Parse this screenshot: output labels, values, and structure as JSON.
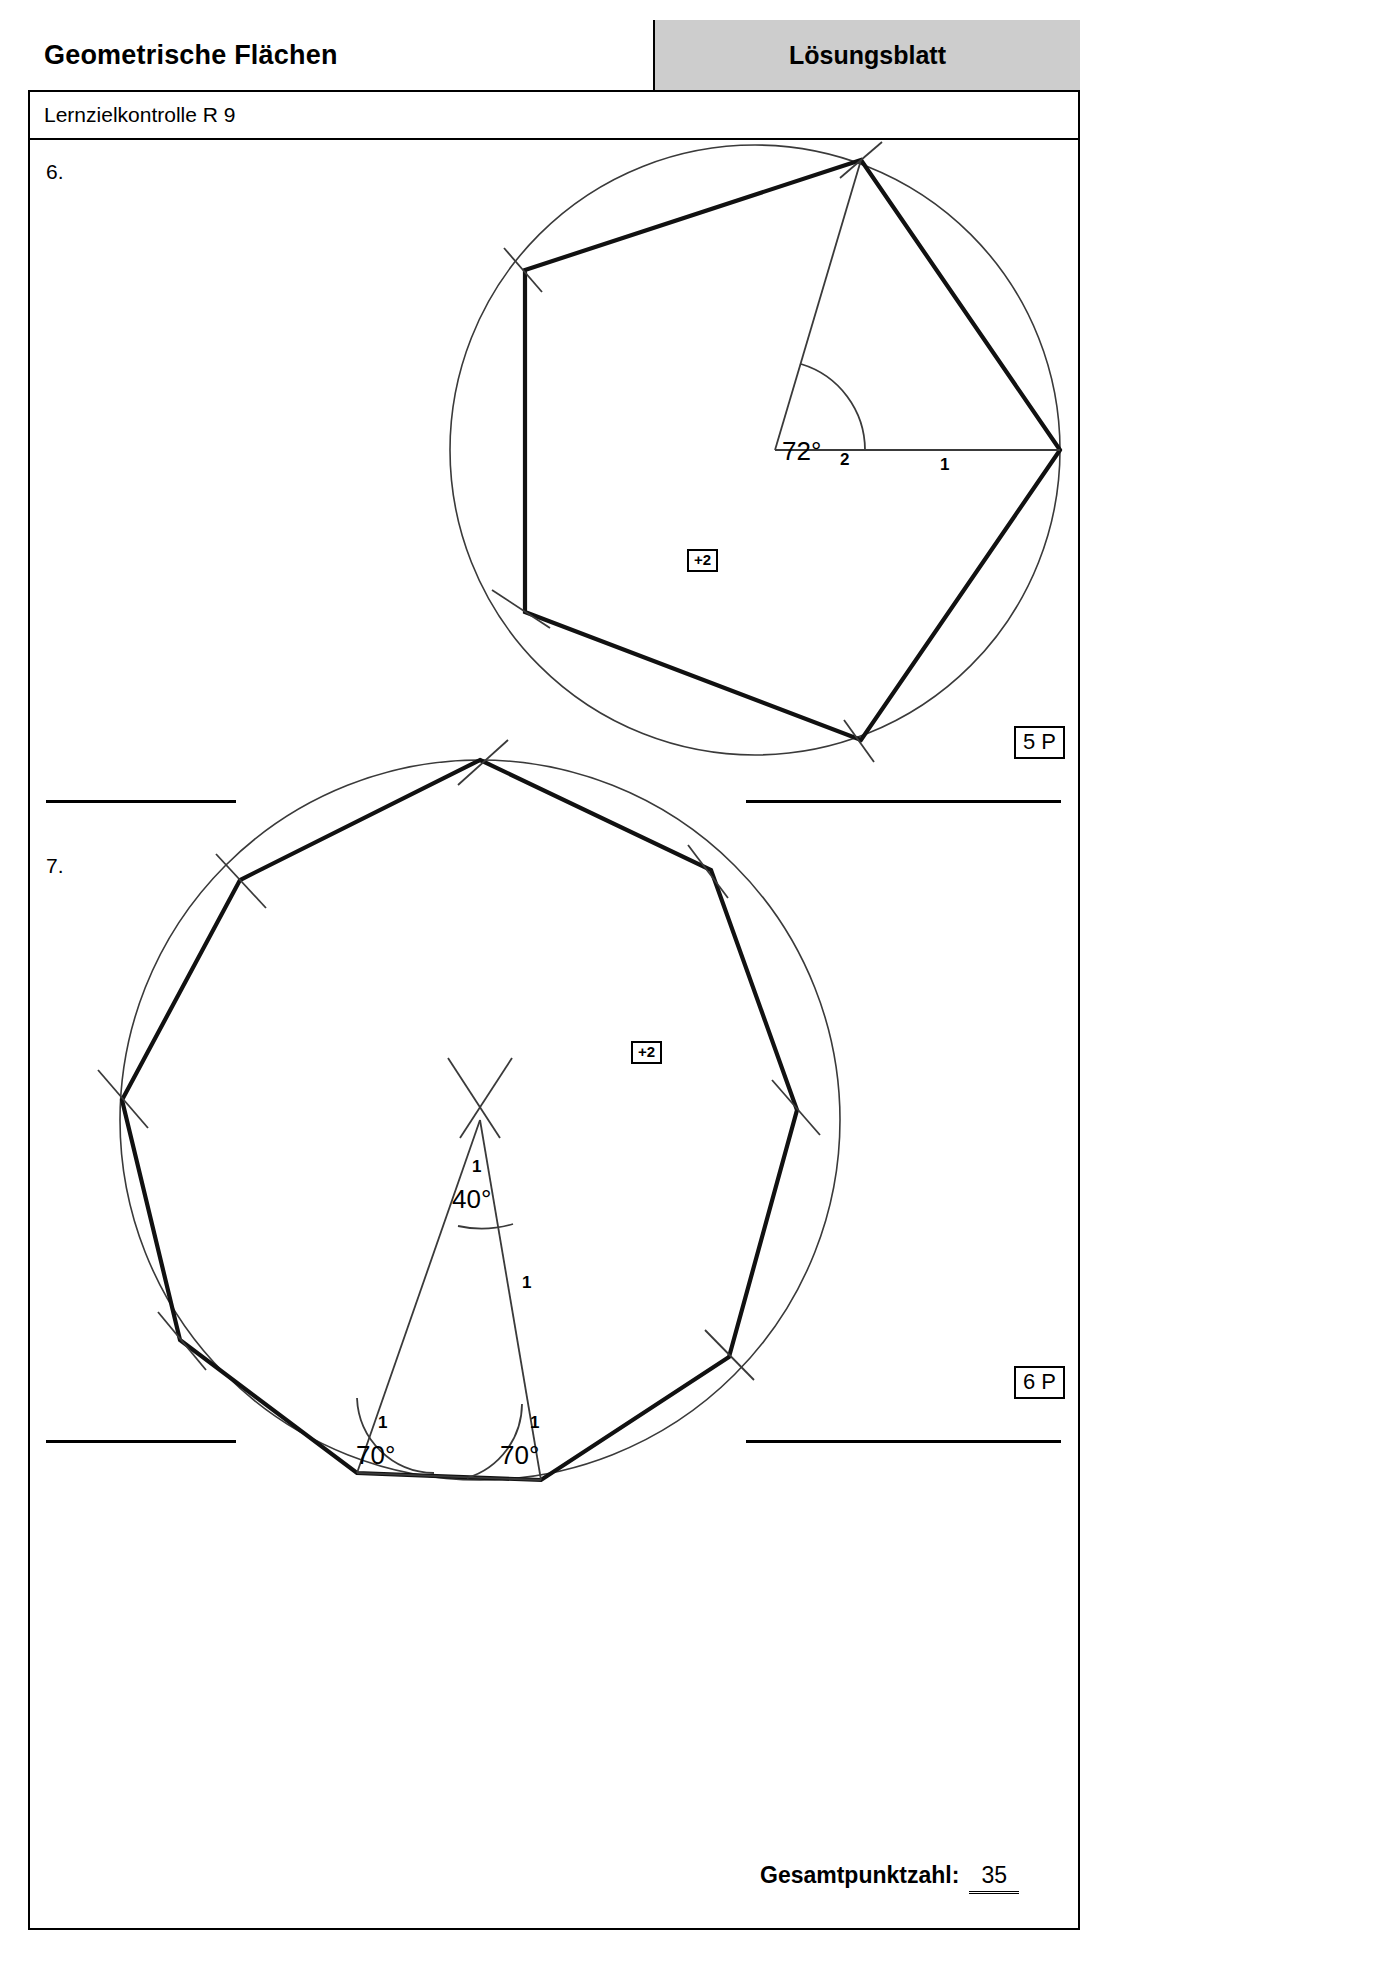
{
  "header": {
    "title": "Geometrische Flächen",
    "sheet_type": "Lösungsblatt",
    "subtitle": "Lernzielkontrolle R 9"
  },
  "tasks": [
    {
      "number": "6.",
      "points_label": "5 P",
      "bonus_label": "+2",
      "figure": {
        "type": "regular-polygon-construction",
        "sides": 5,
        "central_angle": "72°",
        "central_angle_points": "2",
        "radius_label": "1"
      }
    },
    {
      "number": "7.",
      "points_label": "6 P",
      "bonus_label": "+2",
      "figure": {
        "type": "regular-polygon-construction",
        "sides": 9,
        "apex_angle": "40°",
        "apex_angle_points": "1",
        "base_angle_left": "70°",
        "base_angle_left_points": "1",
        "base_angle_right": "70°",
        "base_angle_right_points": "1",
        "side_label": "1"
      }
    }
  ],
  "footer": {
    "total_label": "Gesamtpunktzahl:",
    "total_value": "35"
  }
}
